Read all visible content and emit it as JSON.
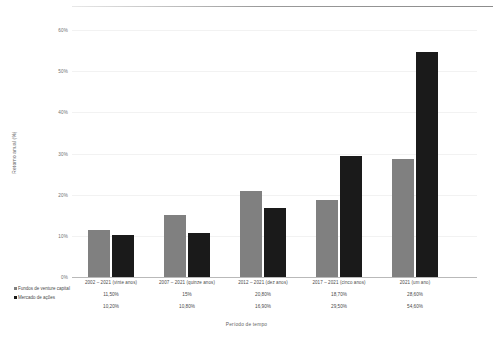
{
  "chart_data": {
    "type": "bar",
    "title": "",
    "xlabel": "Período de tempo",
    "ylabel": "Retorno anual (%)",
    "ylim": [
      0,
      62
    ],
    "yticks": [
      "0%",
      "10%",
      "20%",
      "30%",
      "40%",
      "50%",
      "60%"
    ],
    "ytick_values": [
      0,
      10,
      20,
      30,
      40,
      50,
      60
    ],
    "grid": false,
    "legend_position": "bottom-left",
    "categories": [
      "2002 – 2021 (vinte anos)",
      "2007 – 2021 (quinze anos)",
      "2012 – 2021 (dez anos)",
      "2017 – 2021 (cinco anos)",
      "2021 (um ano)"
    ],
    "series": [
      {
        "name": "Fundos de venture capital",
        "color": "#808080",
        "values": [
          11.5,
          15.0,
          20.8,
          18.7,
          28.6
        ],
        "labels": [
          "11,50%",
          "15%",
          "20,80%",
          "18,70%",
          "28,60%"
        ]
      },
      {
        "name": "Mercado de ações",
        "color": "#1a1a1a",
        "values": [
          10.2,
          10.8,
          16.9,
          29.5,
          54.6
        ],
        "labels": [
          "10,20%",
          "10,80%",
          "16,90%",
          "29,50%",
          "54,60%"
        ]
      }
    ]
  }
}
